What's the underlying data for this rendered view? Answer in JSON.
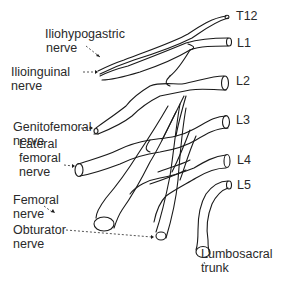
{
  "diagram": {
    "roots": {
      "t12": "T12",
      "l1": "L1",
      "l2": "L2",
      "l3": "L3",
      "l4": "L4",
      "l5": "L5"
    },
    "labels": {
      "iliohypogastric": [
        "Iliohypogastric",
        "nerve"
      ],
      "ilioinguinal": [
        "Ilioinguinal",
        "nerve"
      ],
      "genitofemoral": [
        "Genitofemoral",
        "nerve"
      ],
      "lateral_femoral": [
        "Lateral",
        "femoral",
        "nerve"
      ],
      "femoral": [
        "Femoral",
        "nerve"
      ],
      "obturator": [
        "Obturator",
        "nerve"
      ],
      "lumbosacral": [
        "Lumbosacral",
        "trunk"
      ]
    },
    "colors": {
      "line": "#1a1a1a",
      "text": "#2a2a2a",
      "background": "#ffffff"
    }
  }
}
